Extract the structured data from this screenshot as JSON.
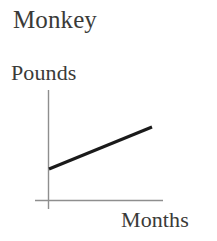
{
  "figure": {
    "title": "Monkey",
    "background_color": "#ffffff",
    "text_color": "#3a3a38"
  },
  "axes": {
    "y_label": "Pounds",
    "x_label": "Months",
    "axis_color": "#8e8e8e",
    "y_axis": {
      "x": 48.5,
      "y_top": 90,
      "y_bottom": 209
    },
    "x_axis": {
      "y": 200.5,
      "x_left": 35,
      "x_right": 163
    }
  },
  "chart_data": {
    "type": "line",
    "title": "Monkey",
    "xlabel": "Months",
    "ylabel": "Pounds",
    "series": [
      {
        "name": "Monkey weight",
        "color": "#1a1a1a",
        "line_width": 3,
        "points": [
          {
            "x": 0,
            "y": 1
          },
          {
            "x": 10,
            "y": 2.4
          }
        ],
        "pixel_points": [
          {
            "x": 49,
            "y": 169
          },
          {
            "x": 152,
            "y": 127
          }
        ]
      }
    ],
    "xlim": [
      0,
      11.5
    ],
    "ylim": [
      0,
      3.2
    ],
    "grid": false,
    "legend": null,
    "tick_labels": {
      "x": [],
      "y": []
    },
    "trend": "increasing"
  }
}
